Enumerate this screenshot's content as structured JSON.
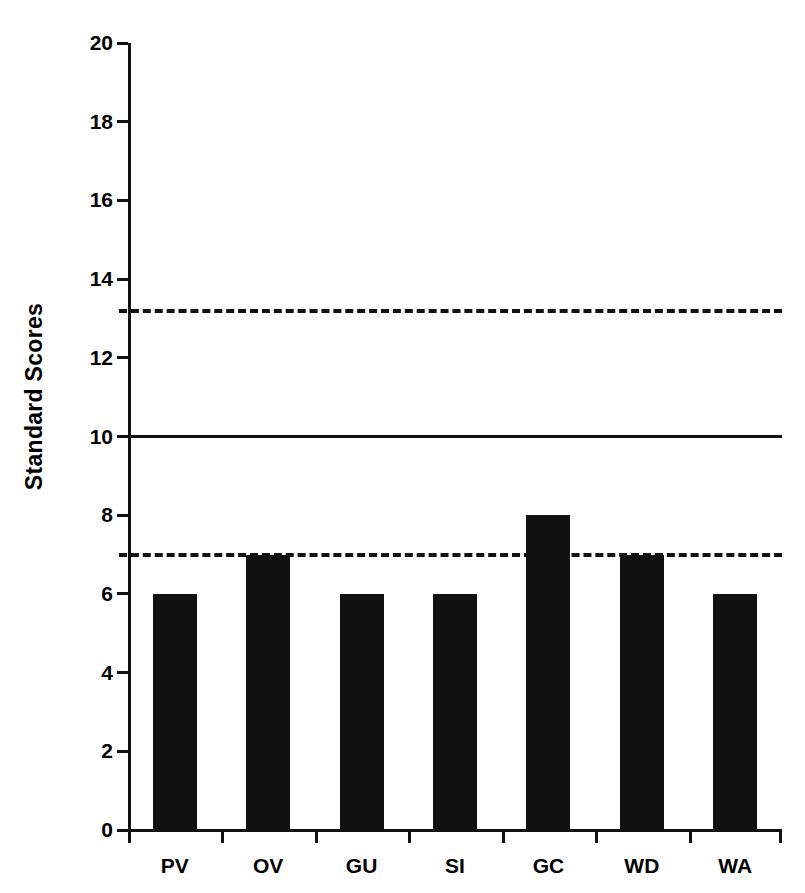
{
  "chart_data": {
    "type": "bar",
    "title": "",
    "subtitle": "",
    "xlabel": "",
    "ylabel": "Standard Scores",
    "categories": [
      "PV",
      "OV",
      "GU",
      "SI",
      "GC",
      "WD",
      "WA"
    ],
    "values": [
      6,
      7,
      6,
      6,
      8,
      7,
      6
    ],
    "series": [
      {
        "name": "Standard Scores",
        "values": [
          6,
          7,
          6,
          6,
          8,
          7,
          6
        ],
        "color": "#111111"
      }
    ],
    "ylim": [
      0,
      20
    ],
    "yticks": [
      0,
      2,
      4,
      6,
      8,
      10,
      12,
      14,
      16,
      18,
      20
    ],
    "ytick_labels": [
      "0",
      "2",
      "4",
      "6",
      "8",
      "10",
      "12",
      "14",
      "16",
      "18",
      "20"
    ],
    "grid": false,
    "legend": false,
    "legend_position": "none",
    "bar_color": "#111111",
    "background_color": "#ffffff",
    "reference_lines": [
      {
        "name": "mean-line",
        "value": 10,
        "style": "solid",
        "color": "#111111"
      },
      {
        "name": "upper-band-line",
        "value": 13.2,
        "style": "dashed",
        "color": "#111111"
      },
      {
        "name": "lower-band-line",
        "value": 7,
        "style": "dashed",
        "color": "#111111"
      }
    ],
    "annotations": []
  }
}
